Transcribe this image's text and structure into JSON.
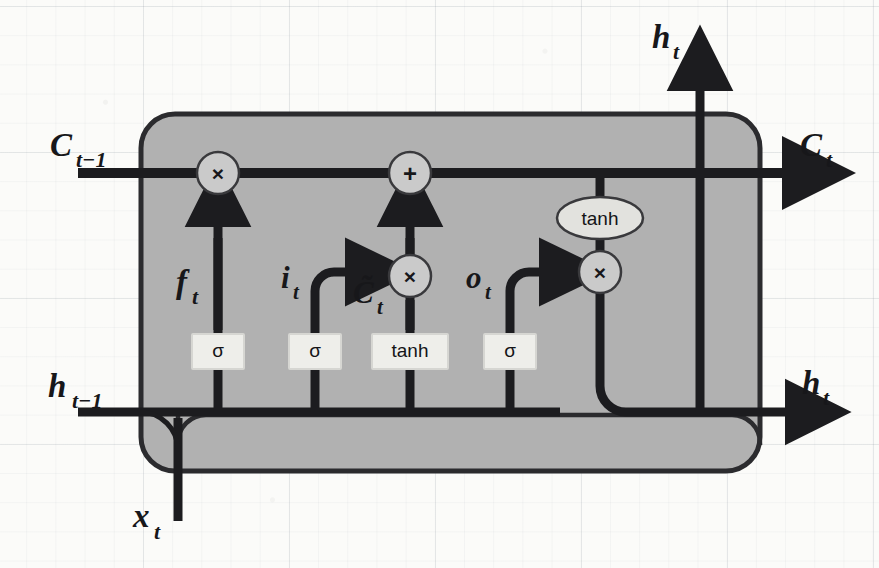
{
  "figure": {
    "kind": "lstm-cell-diagram",
    "background": "#fbfbf9",
    "cell_fill": "#b0b0b0",
    "cell_stroke": "#2b2b2e",
    "gate_box_fill": "#eeeeea",
    "line_color": "#1c1c1f",
    "op_circle_fill": "#cfcfcf"
  },
  "inputs": [
    {
      "id": "c-prev",
      "label": "C",
      "sub": "t−1",
      "role": "previous-cell-state",
      "side": "left-top"
    },
    {
      "id": "h-prev",
      "label": "h",
      "sub": "t−1",
      "role": "previous-hidden-state",
      "side": "left-bottom"
    },
    {
      "id": "x-t",
      "label": "x",
      "sub": "t",
      "role": "current-input",
      "side": "bottom"
    }
  ],
  "outputs": [
    {
      "id": "c-out",
      "label": "C",
      "sub": "t",
      "role": "cell-state-out",
      "side": "right-top"
    },
    {
      "id": "h-out-top",
      "label": "h",
      "sub": "t",
      "role": "hidden-state-out-top",
      "side": "top"
    },
    {
      "id": "h-out-right",
      "label": "h",
      "sub": "t",
      "role": "hidden-state-out-right",
      "side": "right-bottom"
    }
  ],
  "gates": [
    {
      "id": "forget-gate",
      "activation": "σ",
      "signal": "f",
      "signal_sub": "t",
      "name": "forget gate"
    },
    {
      "id": "input-gate",
      "activation": "σ",
      "signal": "i",
      "signal_sub": "t",
      "name": "input gate"
    },
    {
      "id": "candidate",
      "activation": "tanh",
      "signal": "C̃",
      "signal_sub": "t",
      "name": "candidate cell state"
    },
    {
      "id": "output-gate",
      "activation": "σ",
      "signal": "o",
      "signal_sub": "t",
      "name": "output gate"
    }
  ],
  "operators": [
    {
      "id": "forget-mult",
      "glyph": "×",
      "name": "pointwise multiply (forget)"
    },
    {
      "id": "state-add",
      "glyph": "+",
      "name": "pointwise add"
    },
    {
      "id": "input-mult",
      "glyph": "×",
      "name": "pointwise multiply (input)"
    },
    {
      "id": "output-mult",
      "glyph": "×",
      "name": "pointwise multiply (output)"
    }
  ],
  "activations": [
    {
      "id": "state-tanh",
      "label": "tanh",
      "shape": "ellipse",
      "name": "cell state tanh"
    }
  ],
  "signal_labels": {
    "f_t": {
      "base": "f",
      "sub": "t"
    },
    "i_t": {
      "base": "i",
      "sub": "t"
    },
    "c_tilde_t": {
      "base": "C̃",
      "sub": "t"
    },
    "o_t": {
      "base": "o",
      "sub": "t"
    },
    "c_prev": {
      "base": "C",
      "sub": "t−1"
    },
    "h_prev": {
      "base": "h",
      "sub": "t−1"
    },
    "x_t": {
      "base": "x",
      "sub": "t"
    },
    "c_t": {
      "base": "C",
      "sub": "t"
    },
    "h_t": {
      "base": "h",
      "sub": "t"
    }
  },
  "gate_box_texts": {
    "sigma": "σ",
    "tanh": "tanh"
  }
}
